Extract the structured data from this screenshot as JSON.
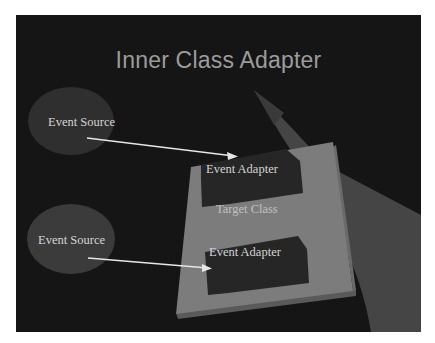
{
  "slide": {
    "title": "Inner Class Adapter",
    "colors": {
      "background": "#151515",
      "title": "#9c9c9c",
      "panel": "#7a7a7a",
      "adapter": "#262626",
      "ellipse": "#3a3a3a",
      "band": "#4a4a4a",
      "arrow": "#e6e6e6"
    },
    "diagram": {
      "event_sources": [
        {
          "label": "Event Source"
        },
        {
          "label": "Event Source"
        }
      ],
      "target_class": {
        "label": "Target Class"
      },
      "event_adapters": [
        {
          "label": "Event Adapter"
        },
        {
          "label": "Event Adapter"
        }
      ],
      "arrows": [
        {
          "from": "Event Source",
          "to": "Event Adapter"
        },
        {
          "from": "Event Source",
          "to": "Event Adapter"
        }
      ]
    }
  }
}
